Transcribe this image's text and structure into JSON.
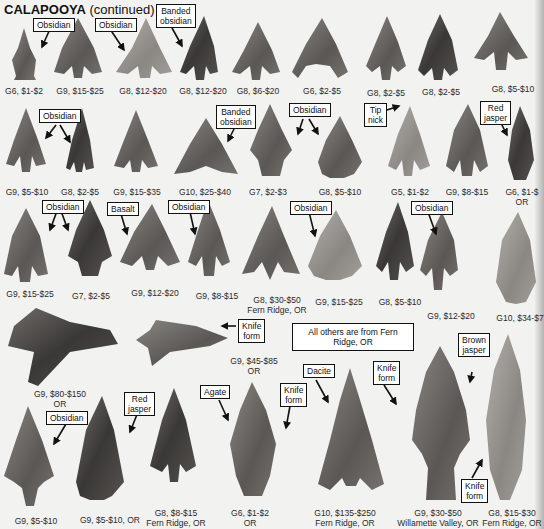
{
  "page": {
    "title_bold": "CALAPOOYA",
    "title_rest": " (continued)",
    "note": "All others are from Fern Ridge, OR"
  },
  "tags": {
    "obsidian": "Obsidian",
    "banded_obsidian_l1": "Banded",
    "banded_obsidian_l2": "obsidian",
    "tip_nick_l1": "Tip",
    "tip_nick_l2": "nick",
    "red_jasper_l1": "Red",
    "red_jasper_l2": "jasper",
    "basalt": "Basalt",
    "knife_form_l1": "Knife",
    "knife_form_l2": "form",
    "agate": "Agate",
    "dacite": "Dacite",
    "brown_jasper_l1": "Brown",
    "brown_jasper_l2": "jasper"
  },
  "captions": {
    "row1": [
      "G6, $1-$2",
      "G9, $15-$25",
      "G8, $12-$20",
      "G8, $12-$20",
      "G8, $6-$20",
      "G6, $2-$5",
      "G8, $2-$5",
      "G8, $2-$5",
      "G8, $5-$10"
    ],
    "row2": [
      "G9, $5-$10",
      "G8, $2-$5",
      "G9, $15-$35",
      "G10, $25-$40",
      "G7, $2-$3",
      "G8, $5-$10",
      "G5, $1-$2",
      "G9, $8-$15",
      "G6, $1-$"
    ],
    "row2_last_line2": "OR",
    "row3": [
      "G9, $15-$25",
      "G7, $2-$5",
      "G9, $12-$20",
      "G9, $8-$15",
      "G8, $30-$50",
      "G9, $15-$25",
      "G8, $5-$10",
      "G9, $12-$20",
      "G10, $34-$7"
    ],
    "row3_line2_g8": "Fern Ridge, OR",
    "row4": [
      "G9, $80-$150",
      "G9, $45-$85"
    ],
    "row4_line2": "OR",
    "row5": [
      "G9, $5-$10",
      "G9, $5-$10, OR",
      "G8, $8-$15",
      "G6, $1-$2",
      "G10, $135-$250",
      "G9, $30-$50",
      "G8, $15-$30"
    ],
    "row5_line2": [
      "",
      "",
      "Fern Ridge, OR",
      "OR",
      "Fern Ridge, OR",
      "Willamette Valley, OR",
      "Fern Ridge, OR"
    ]
  },
  "colors": {
    "paper": "#f2f2f0",
    "stone_dark": "#3a3836",
    "stone_mid": "#6b6864",
    "stone_light": "#9a9692"
  }
}
